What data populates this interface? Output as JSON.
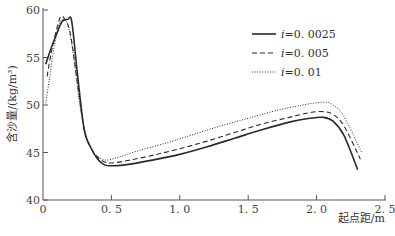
{
  "chart_data": {
    "type": "line",
    "title": "",
    "xlabel": "起点距/m",
    "ylabel": "含沙量/(kg/m³)",
    "xlim": [
      0,
      2.5
    ],
    "ylim": [
      40,
      60
    ],
    "xticks": [
      "0",
      "0.5",
      "1.0",
      "1.5",
      "2.0",
      "2.5"
    ],
    "yticks": [
      "40",
      "45",
      "50",
      "55",
      "60"
    ],
    "grid": false,
    "legend_position": "upper right",
    "series": [
      {
        "name": "i=0.0025",
        "style": "solid",
        "x": [
          0.02,
          0.06,
          0.1,
          0.14,
          0.18,
          0.21,
          0.25,
          0.3,
          0.35,
          0.4,
          0.45,
          0.5,
          0.6,
          0.8,
          1.0,
          1.2,
          1.4,
          1.6,
          1.8,
          1.95,
          2.05,
          2.12,
          2.2,
          2.3
        ],
        "values": [
          54.3,
          56.0,
          57.5,
          58.8,
          59.0,
          58.8,
          53.5,
          47.5,
          45.5,
          44.3,
          43.7,
          43.6,
          43.7,
          44.2,
          44.8,
          45.6,
          46.5,
          47.4,
          48.2,
          48.6,
          48.7,
          48.3,
          46.8,
          43.2
        ]
      },
      {
        "name": "i=0.005",
        "style": "dashed",
        "x": [
          0.03,
          0.06,
          0.1,
          0.13,
          0.16,
          0.2,
          0.25,
          0.3,
          0.35,
          0.4,
          0.45,
          0.5,
          0.6,
          0.8,
          1.0,
          1.2,
          1.4,
          1.6,
          1.8,
          1.95,
          2.05,
          2.12,
          2.2,
          2.32
        ],
        "values": [
          53.0,
          55.5,
          58.0,
          59.3,
          59.0,
          57.5,
          52.5,
          47.5,
          45.5,
          44.5,
          44.0,
          43.9,
          44.1,
          44.7,
          45.4,
          46.2,
          47.1,
          48.0,
          48.7,
          49.2,
          49.3,
          49.0,
          47.8,
          44.3
        ]
      },
      {
        "name": "i=0.01",
        "style": "dotted",
        "x": [
          0.02,
          0.05,
          0.08,
          0.12,
          0.15,
          0.18,
          0.22,
          0.27,
          0.32,
          0.37,
          0.42,
          0.47,
          0.55,
          0.7,
          0.9,
          1.1,
          1.3,
          1.5,
          1.7,
          1.9,
          2.05,
          2.12,
          2.2,
          2.33
        ],
        "values": [
          50.2,
          53.0,
          56.0,
          58.5,
          59.0,
          58.5,
          55.5,
          50.0,
          46.5,
          45.0,
          44.4,
          44.2,
          44.5,
          45.2,
          46.0,
          46.9,
          47.8,
          48.6,
          49.4,
          50.0,
          50.3,
          50.0,
          48.8,
          45.0
        ]
      }
    ]
  },
  "legend": {
    "items": [
      {
        "label": "i=0.0025",
        "style": "solid"
      },
      {
        "label": "i=0.005",
        "style": "dashed"
      },
      {
        "label": "i=0.01",
        "style": "dotted"
      }
    ]
  },
  "axes": {
    "x_label": "起点距/m",
    "y_label": "含沙量/(kg/m³)",
    "x_ticks": [
      "0",
      "0.5",
      "1.0",
      "1.5",
      "2.0",
      "2.5"
    ],
    "y_ticks": [
      "40",
      "45",
      "50",
      "55",
      "60"
    ]
  },
  "colors": {
    "line": "#2a2a2a",
    "axis": "#555555"
  }
}
